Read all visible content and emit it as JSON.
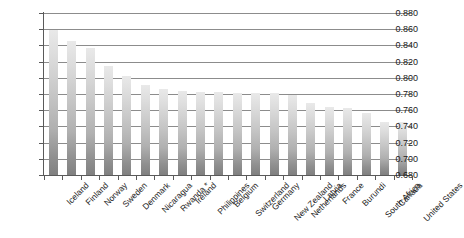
{
  "chart_data": {
    "type": "bar",
    "title": "",
    "subtitle": "",
    "xlabel": "",
    "ylabel": "",
    "ylim": [
      0.68,
      0.88
    ],
    "ytick_step": 0.02,
    "grid": true,
    "legend": false,
    "legend_position": "none",
    "ytick_labels": [
      "0.880",
      "0.860",
      "0.840",
      "0.820",
      "0.800",
      "0.780",
      "0.760",
      "0.740",
      "0.720",
      "0.700",
      "0.680"
    ],
    "ytick_values": [
      0.88,
      0.86,
      0.84,
      0.82,
      0.8,
      0.78,
      0.76,
      0.74,
      0.72,
      0.7,
      0.68
    ],
    "categories": [
      "Iceland",
      "Finland",
      "Norway",
      "Sweden",
      "Denmark",
      "Nicaragua",
      "Rwanda *",
      "Ireland",
      "Philippines",
      "Belgium",
      "Switzerland",
      "Germany",
      "New Zealand",
      "Netherlands",
      "Latvia",
      "France",
      "Burundi",
      "South Africa",
      "Canada",
      "United States"
    ],
    "values": [
      0.859,
      0.845,
      0.837,
      0.814,
      0.802,
      0.791,
      0.786,
      0.784,
      0.783,
      0.782,
      0.781,
      0.781,
      0.781,
      0.779,
      0.769,
      0.764,
      0.763,
      0.756,
      0.746,
      0.746
    ],
    "bar_color": "#c8c8c8",
    "gridline_color": "#8c8c8c",
    "axis_color": "#5a5a5a",
    "text_color": "#1a1a1a",
    "background_color": "#ffffff"
  }
}
